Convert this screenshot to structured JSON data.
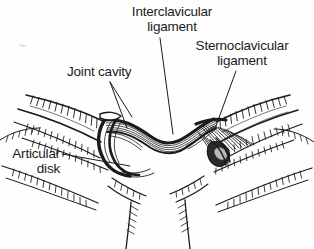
{
  "figure": {
    "style": "black-and-white line drawing with hatching",
    "background_color": "#fefefe",
    "ink_color": "#1b1b1b"
  },
  "labels": {
    "interclavicular": {
      "line1": "Interclavicular",
      "line2": "ligament"
    },
    "sternoclavicular": {
      "line1": "Sternoclavicular",
      "line2": "ligament"
    },
    "joint_cavity": {
      "line1": "Joint cavity"
    },
    "articular_disk": {
      "line1": "Articular",
      "line2": "disk"
    }
  },
  "leader_lines": [
    {
      "name": "interclavicular-leader",
      "from": [
        160,
        38
      ],
      "to": [
        173,
        134
      ]
    },
    {
      "name": "sternoclavicular-leader",
      "from": [
        236,
        71
      ],
      "to": [
        216,
        126
      ]
    },
    {
      "name": "joint-cavity-leader-upper",
      "from": [
        110,
        82
      ],
      "to": [
        131,
        117
      ]
    },
    {
      "name": "joint-cavity-leader-lower",
      "from": [
        110,
        82
      ],
      "to": [
        127,
        126
      ]
    },
    {
      "name": "articular-disk-leader",
      "from": [
        62,
        154
      ],
      "to": [
        130,
        166
      ]
    }
  ],
  "structures": [
    {
      "name": "left-clavicle",
      "description": "curved bone shaft entering from upper left"
    },
    {
      "name": "right-clavicle",
      "description": "curved bone shaft entering from upper right"
    },
    {
      "name": "interclavicular-ligament",
      "description": "striated band spanning between clavicles across midline"
    },
    {
      "name": "left-articular-disk",
      "description": "dark crescent between left clavicle and manubrium"
    },
    {
      "name": "right-sternoclavicular-ligament",
      "description": "dense hatched fan on right joint"
    },
    {
      "name": "manubrium",
      "description": "central sternum body below the joints"
    },
    {
      "name": "first-rib-left",
      "description": "costal cartilage at lower left"
    },
    {
      "name": "first-rib-right",
      "description": "costal cartilage at lower right"
    }
  ]
}
